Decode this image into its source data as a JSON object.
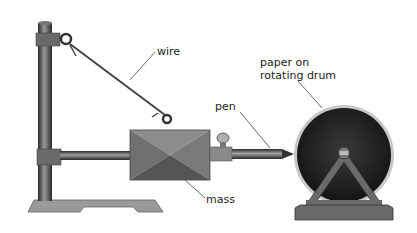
{
  "diagram": {
    "labels": {
      "wire": "wire",
      "pen": "pen",
      "mass": "mass",
      "drum_line1": "paper on",
      "drum_line2": "rotating drum"
    },
    "colors": {
      "stand": "#4a4a4a",
      "mass_light": "#8a8a8a",
      "mass_dark": "#5a5a5a",
      "drum": "#2a2a2a",
      "base": "#9a9a9a"
    }
  }
}
